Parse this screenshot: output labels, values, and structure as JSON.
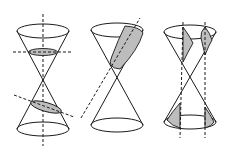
{
  "diagram": {
    "figures": [
      {
        "id": "circle-ellipse",
        "description": "Double cone with a horizontal plane (circle) on the upper nappe and a tilted plane (ellipse) on the lower nappe"
      },
      {
        "id": "parabola",
        "description": "Double cone with a plane parallel to a generator producing a parabola on the upper nappe"
      },
      {
        "id": "hyperbola",
        "description": "Double cone with vertical planes cutting both nappes producing hyperbola branches"
      }
    ],
    "colors": {
      "line": "#1a1a1a",
      "section_fill": "#bdbdbd",
      "background": "#ffffff"
    }
  }
}
